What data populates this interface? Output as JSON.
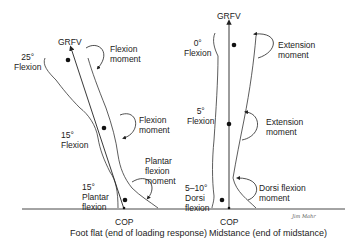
{
  "figure": {
    "left_panel": {
      "vector_label": "GRFV",
      "hip_angle": "25°\nFlexion",
      "hip_moment": "Flexion\nmoment",
      "knee_angle": "15°\nFlexion",
      "knee_moment": "Flexion\nmoment",
      "ankle_angle": "15°\nPlantar\nflexion",
      "ankle_moment": "Plantar\nflexion\nmoment",
      "cop_label": "COP",
      "caption": "Foot flat (end of loading response)"
    },
    "right_panel": {
      "vector_label": "GRFV",
      "hip_angle": "0°\nFlexion",
      "hip_moment": "Extension\nmoment",
      "knee_angle": "5°\nFlexion",
      "knee_moment": "Extension\nmoment",
      "ankle_angle": "5–10°\nDorsi\nflexion",
      "ankle_moment": "Dorsi flexion\nmoment",
      "cop_label": "COP",
      "caption": "Midstance (end of midstance)"
    },
    "signature": "Jim Mahr"
  }
}
